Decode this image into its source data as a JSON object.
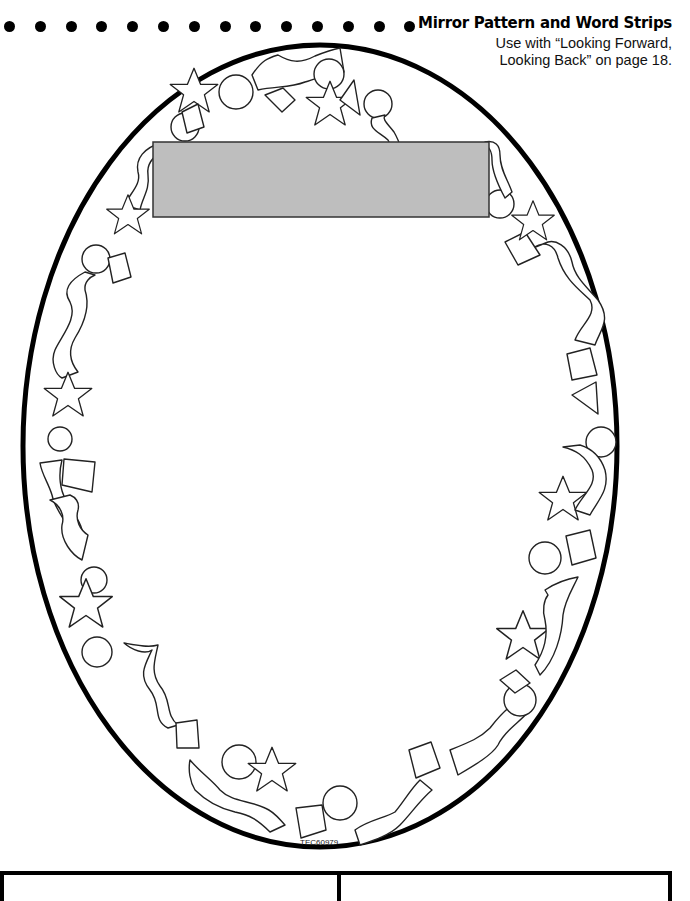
{
  "header": {
    "title": "Mirror Pattern and Word Strips",
    "subtitle_line1": "Use with “Looking Forward,",
    "subtitle_line2": "Looking Back” on page 18.",
    "dot_count": 15
  },
  "mirror": {
    "shape": "oval-frame",
    "border_color": "#000000",
    "label_box_color": "#BEBEBE",
    "label_box_text": "",
    "decorations": [
      "star",
      "circle",
      "square",
      "triangle",
      "ribbon"
    ]
  },
  "footer": {
    "code": "TEC60979"
  },
  "word_strips": [
    {
      "label": ""
    },
    {
      "label": ""
    }
  ],
  "colors": {
    "ink": "#000000",
    "paper": "#FFFFFF",
    "gray_box": "#BEBEBE"
  }
}
